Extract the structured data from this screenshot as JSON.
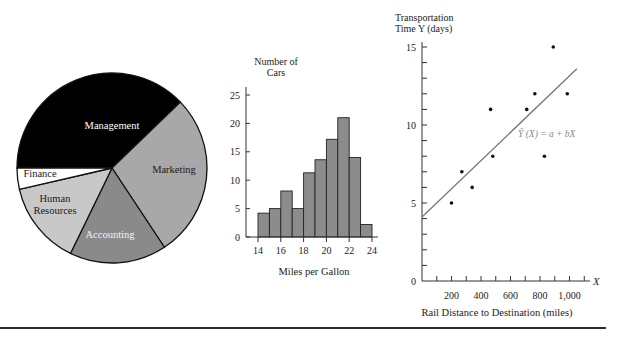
{
  "chart_data": [
    {
      "type": "pie",
      "title": "",
      "categories": [
        "Management",
        "Marketing",
        "Accounting",
        "Human Resources",
        "Finance"
      ],
      "values": [
        37.8,
        27.9,
        16.5,
        14.2,
        3.6
      ],
      "unit": "percent (estimated from slice angles)",
      "colors": [
        "#000000",
        "#a8a8a8",
        "#8a8a8a",
        "#c8c8c8",
        "#ffffff"
      ],
      "label_colors": [
        "#ffffff",
        "#1a1a1a",
        "#f2f2f2",
        "#1a1a1a",
        "#1a1a1a"
      ],
      "labels_display": [
        [
          "Management"
        ],
        [
          "Marketing"
        ],
        [
          "Accounting"
        ],
        [
          "Human",
          "Resources"
        ],
        [
          "Finance"
        ]
      ],
      "start_angle_deg": 180,
      "legend": "none (labels inside slices)"
    },
    {
      "type": "bar",
      "subtype": "histogram",
      "title": "",
      "ylabel": "Number of Cars",
      "ylabel_lines": [
        "Number of",
        "Cars"
      ],
      "xlabel": "Miles per Gallon",
      "bin_edges": [
        14,
        15,
        16,
        17,
        18,
        19,
        20,
        21,
        22,
        23,
        24
      ],
      "categories": [
        "14-15",
        "15-16",
        "16-17",
        "17-18",
        "18-19",
        "19-20",
        "20-21",
        "21-22",
        "22-23",
        "23-24"
      ],
      "values": [
        4.2,
        5,
        8.1,
        5,
        11.3,
        13.6,
        17.2,
        21,
        14,
        2.2
      ],
      "xticks": [
        14,
        16,
        18,
        20,
        22,
        24
      ],
      "yticks": [
        0,
        5,
        10,
        15,
        20,
        25
      ],
      "xlim": [
        14,
        24
      ],
      "ylim": [
        0,
        27
      ],
      "bar_color": "#8c8c8c",
      "grid": false
    },
    {
      "type": "scatter",
      "title": "",
      "ylabel": "Transportation Time Y (days)",
      "ylabel_lines": [
        "Transportation",
        "Time Y (days)"
      ],
      "xlabel": "Rail Distance to Destination (miles)",
      "x_axis_symbol": "X",
      "points": [
        {
          "x": 200,
          "y": 5
        },
        {
          "x": 270,
          "y": 7
        },
        {
          "x": 340,
          "y": 6
        },
        {
          "x": 465,
          "y": 11
        },
        {
          "x": 480,
          "y": 8
        },
        {
          "x": 710,
          "y": 11
        },
        {
          "x": 765,
          "y": 12
        },
        {
          "x": 830,
          "y": 8
        },
        {
          "x": 890,
          "y": 15
        },
        {
          "x": 985,
          "y": 12
        }
      ],
      "regression_line": {
        "x0": 0,
        "y0": 4.1,
        "x1": 1050,
        "y1": 13.6,
        "label": "Ŷ (X) = a + bX",
        "color": "#777777"
      },
      "xticks_minor_step": 100,
      "xtick_labels": [
        200,
        400,
        600,
        800,
        "1,000"
      ],
      "xtick_label_values": [
        200,
        400,
        600,
        800,
        1000
      ],
      "yticks_minor_step": 1,
      "ytick_labels": [
        0,
        5,
        10,
        15
      ],
      "xlim": [
        0,
        1130
      ],
      "ylim": [
        0,
        15.4
      ],
      "grid": false
    }
  ],
  "layout": {
    "pie": {
      "cx": 112,
      "cy": 168,
      "r": 95
    },
    "hist": {
      "x0": 246,
      "y0": 237,
      "bar_left": 258,
      "bar_w": 11.4,
      "px_per_unit": 5.68,
      "axis_top": 87
    },
    "scatter": {
      "x0": 422,
      "y0": 281,
      "px_per_x": 0.1475,
      "px_per_y": 15.6,
      "axis_right": 590,
      "axis_top": 42
    }
  }
}
